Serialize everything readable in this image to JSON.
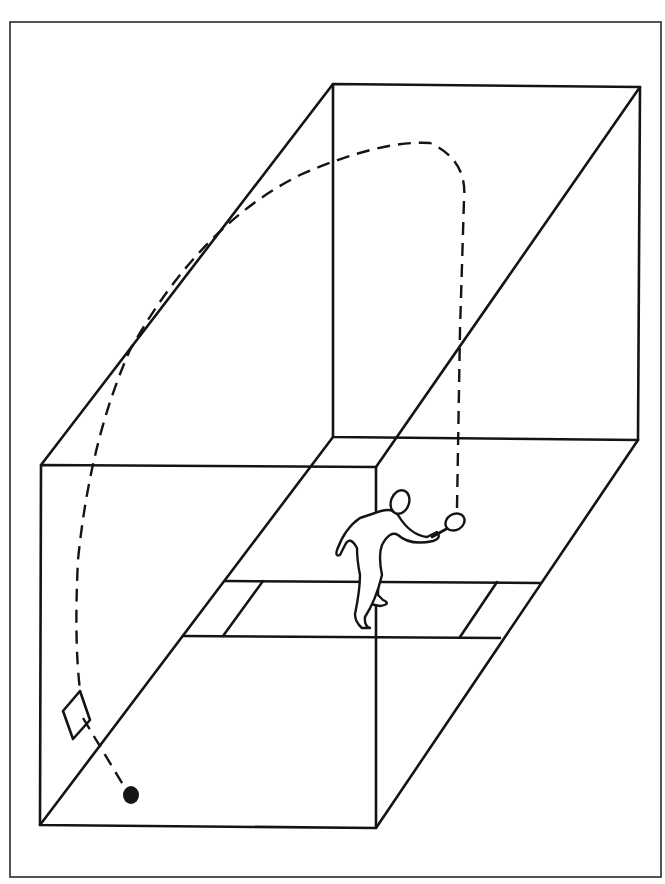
{
  "diagram": {
    "colors": {
      "ink": "#141414",
      "background": "#ffffff",
      "frame": "#2a2a2a"
    },
    "elements": [
      {
        "id": "court",
        "label": "Court box (perspective)"
      },
      {
        "id": "service-zone",
        "label": "Service zone lines"
      },
      {
        "id": "player",
        "label": "Player with racquet"
      },
      {
        "id": "trajectory",
        "label": "Ball path (dashed)"
      },
      {
        "id": "bounce-mark",
        "label": "Bounce marker (diamond)"
      },
      {
        "id": "ball",
        "label": "Ball"
      }
    ]
  }
}
